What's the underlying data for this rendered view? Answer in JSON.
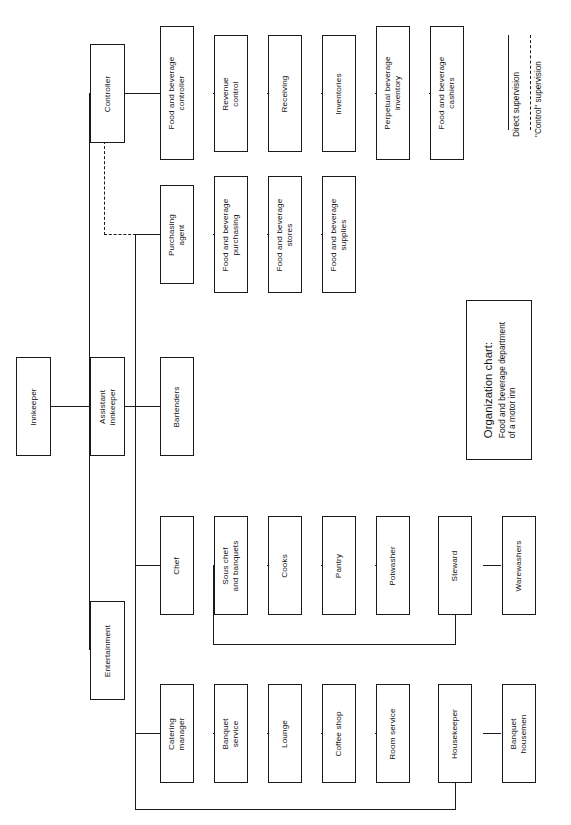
{
  "chart": {
    "caption_title": "Organization chart:",
    "caption_subtitle_line1": "Food and beverage department",
    "caption_subtitle_line2": "of a motor inn",
    "orientation": "rotated-90-counterclockwise"
  },
  "legend": {
    "direct_label": "Direct supervision",
    "control_label": "\"Control\" supervision"
  },
  "nodes": {
    "innkeeper": "Innkeeper",
    "assistant_innkeeper_l1": "Assistant",
    "assistant_innkeeper_l2": "innkeeper",
    "entertainment": "Entertainment",
    "controller": "Controller",
    "fb_controller_l1": "Food and beverage",
    "fb_controller_l2": "controller",
    "revenue_control_l1": "Revenue",
    "revenue_control_l2": "control",
    "receiving": "Receiving",
    "inventories": "Inventories",
    "perpetual_l1": "Perpetual  beverage",
    "perpetual_l2": "inventory",
    "fb_cashiers_l1": "Food and beverage",
    "fb_cashiers_l2": "cashiers",
    "purchasing_agent_l1": "Purchasing",
    "purchasing_agent_l2": "agent",
    "fb_purchasing_l1": "Food and beverage",
    "fb_purchasing_l2": "purchasing",
    "fb_stores_l1": "Food and beverage",
    "fb_stores_l2": "stores",
    "fb_supplies_l1": "Food and beverage",
    "fb_supplies_l2": "supplies",
    "bartenders": "Bartenders",
    "chef": "Chef",
    "sous_chef_l1": "Sous chef",
    "sous_chef_l2": "and banquets",
    "cooks": "Cooks",
    "pantry": "Pantry",
    "potwasher": "Potwasher",
    "steward": "Steward",
    "warewashers": "Warewashers",
    "catering_manager_l1": "Catering",
    "catering_manager_l2": "manager",
    "banquet_service_l1": "Banquet",
    "banquet_service_l2": "service",
    "lounge": "Lounge",
    "coffee_shop": "Coffee shop",
    "room_service": "Room service",
    "housekeeper": "Housekeeper",
    "banquet_housemen_l1": "Banquet",
    "banquet_housemen_l2": "housemen"
  },
  "colors": {
    "line": "#1a1a1a",
    "background": "#ffffff",
    "text": "#111111"
  }
}
